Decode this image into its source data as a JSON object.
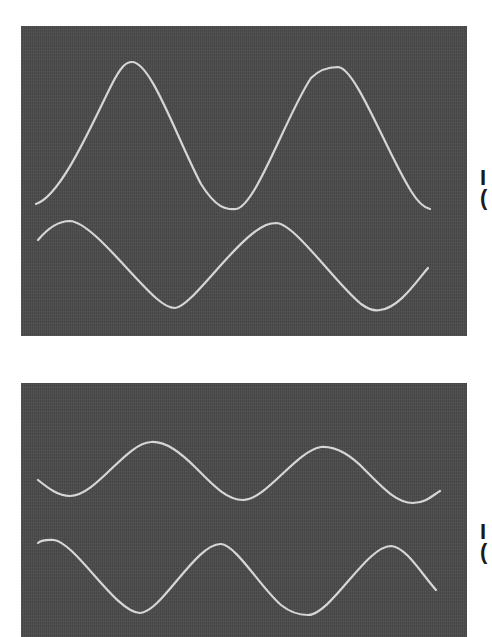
{
  "figure": {
    "panels": [
      {
        "id": "top",
        "trace_color": "#d8d8d8",
        "background_color": "#4a4a4a",
        "traces": [
          {
            "name": "upper-trace",
            "description": "large-amplitude sine, ~2 cycles",
            "amplitude_px": 73,
            "period_px": 205
          },
          {
            "name": "lower-trace",
            "description": "smaller-amplitude sine, phase-shifted",
            "amplitude_px": 44,
            "period_px": 206
          }
        ],
        "edge_label": {
          "line1": "I",
          "line2": "("
        }
      },
      {
        "id": "bottom",
        "trace_color": "#d8d8d8",
        "background_color": "#4a4a4a",
        "traces": [
          {
            "name": "upper-trace",
            "description": "small-amplitude sine, ~2.3 cycles",
            "amplitude_px": 29,
            "period_px": 172
          },
          {
            "name": "lower-trace",
            "description": "medium-amplitude sine, ~2.3 cycles",
            "amplitude_px": 36,
            "period_px": 172
          }
        ],
        "edge_label": {
          "line1": "I",
          "line2": "("
        }
      }
    ]
  }
}
